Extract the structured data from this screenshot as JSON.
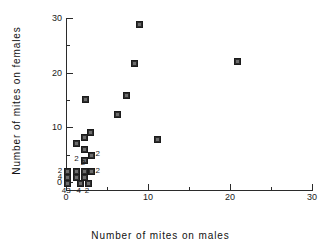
{
  "chart_data": {
    "type": "scatter",
    "title": "",
    "xlabel": "Number of mites on males",
    "ylabel": "Number of mites on females",
    "xlim": [
      0,
      30
    ],
    "ylim": [
      0,
      30
    ],
    "grid": false,
    "legend": null,
    "xticks": [
      0,
      10,
      20,
      30
    ],
    "yticks": [
      0,
      10,
      20,
      30
    ],
    "xtick_labels": [
      "0",
      "10",
      "20",
      "30"
    ],
    "ytick_labels": [
      "0",
      "10",
      "20",
      "30"
    ],
    "xminor_ticks": [
      5,
      15,
      25
    ],
    "yminor_ticks": [
      5,
      15,
      25
    ],
    "marker": "filled-square",
    "marker_color": "#2e2e2e",
    "annotation_note": "Numerals beside markers give the number of coincident observations at that point.",
    "points": [
      {
        "x": 8.9,
        "y": 29.0,
        "count": 1,
        "label": ""
      },
      {
        "x": 20.8,
        "y": 22.3,
        "count": 1,
        "label": ""
      },
      {
        "x": 8.2,
        "y": 21.8,
        "count": 1,
        "label": ""
      },
      {
        "x": 7.2,
        "y": 16.0,
        "count": 1,
        "label": ""
      },
      {
        "x": 2.2,
        "y": 15.3,
        "count": 1,
        "label": ""
      },
      {
        "x": 6.1,
        "y": 12.5,
        "count": 1,
        "label": ""
      },
      {
        "x": 2.9,
        "y": 9.2,
        "count": 1,
        "label": ""
      },
      {
        "x": 2.1,
        "y": 8.3,
        "count": 1,
        "label": ""
      },
      {
        "x": 11.0,
        "y": 7.9,
        "count": 1,
        "label": ""
      },
      {
        "x": 1.1,
        "y": 7.3,
        "count": 1,
        "label": ""
      },
      {
        "x": 2.1,
        "y": 6.1,
        "count": 1,
        "label": ""
      },
      {
        "x": 3.0,
        "y": 5.1,
        "count": 2,
        "label": "2",
        "label_side": "right"
      },
      {
        "x": 2.1,
        "y": 4.2,
        "count": 2,
        "label": "2",
        "label_side": "left"
      },
      {
        "x": 0.1,
        "y": 2.1,
        "count": 2,
        "label": "2",
        "label_side": "left"
      },
      {
        "x": 1.1,
        "y": 2.1,
        "count": 1,
        "label": ""
      },
      {
        "x": 2.1,
        "y": 2.1,
        "count": 2,
        "label": "2",
        "label_side": "above"
      },
      {
        "x": 3.0,
        "y": 2.1,
        "count": 2,
        "label": "2",
        "label_side": "right"
      },
      {
        "x": 0.1,
        "y": 1.0,
        "count": 4,
        "label": "4",
        "label_side": "left"
      },
      {
        "x": 1.1,
        "y": 1.0,
        "count": 1,
        "label": ""
      },
      {
        "x": 2.1,
        "y": 1.0,
        "count": 1,
        "label": ""
      },
      {
        "x": 0.1,
        "y": 0.0,
        "count": 43,
        "label": "43",
        "label_side": "below"
      },
      {
        "x": 1.6,
        "y": 0.0,
        "count": 4,
        "label": "4",
        "label_side": "below"
      },
      {
        "x": 2.6,
        "y": 0.0,
        "count": 2,
        "label": "2",
        "label_side": "below"
      }
    ]
  },
  "axes": {
    "x_title": "Number of mites on males",
    "y_title": "Number of mites on females"
  }
}
